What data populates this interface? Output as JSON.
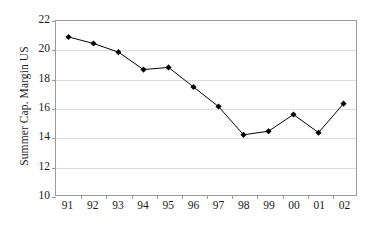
{
  "chart_data": {
    "type": "line",
    "title": "",
    "subtitle": "",
    "xlabel": "",
    "ylabel": "Summer Cap. Margin US",
    "categories": [
      "91",
      "92",
      "93",
      "94",
      "95",
      "96",
      "97",
      "98",
      "99",
      "00",
      "01",
      "02"
    ],
    "values": [
      20.9,
      20.45,
      19.85,
      18.65,
      18.8,
      17.45,
      16.1,
      14.15,
      14.4,
      15.55,
      14.3,
      16.3
    ],
    "series": [
      {
        "name": "Summer Cap. Margin US",
        "values": [
          20.9,
          20.45,
          19.85,
          18.65,
          18.8,
          17.45,
          16.1,
          14.15,
          14.4,
          15.55,
          14.3,
          16.3
        ]
      }
    ],
    "ylim": [
      10,
      22
    ],
    "yticks": [
      10,
      12,
      14,
      16,
      18,
      20,
      22
    ],
    "ytick_labels": [
      "10",
      "12",
      "14",
      "16",
      "18",
      "20",
      "22"
    ],
    "grid": true,
    "grid_axis": "y",
    "legend": false,
    "legend_position": "none",
    "marker": "diamond",
    "marker_color": "#000000",
    "line_color": "#000000",
    "gridline_color": "#dcdcdc",
    "axis_color": "#9a9a9a",
    "plot_background": "#ffffff"
  }
}
